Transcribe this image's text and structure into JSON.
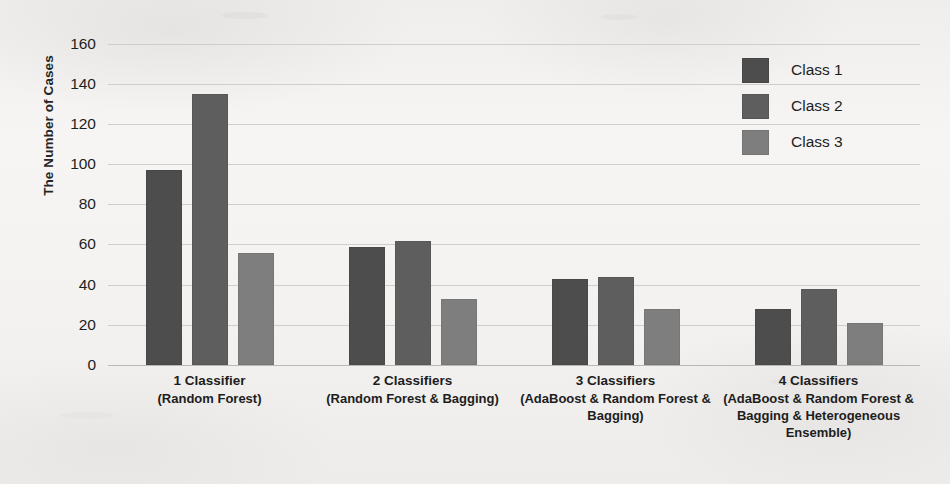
{
  "chart_data": {
    "type": "bar",
    "title": "",
    "xlabel": "",
    "ylabel": "The Number of Cases",
    "ylim": [
      0,
      160
    ],
    "ytick_step": 20,
    "yticks": [
      160,
      140,
      120,
      100,
      80,
      60,
      40,
      20,
      0
    ],
    "grid": true,
    "legend_position": "top-right",
    "categories": [
      "1 Classifier\n(Random Forest)",
      "2 Classifiers\n(Random Forest & Bagging)",
      "3 Classifiers\n(AdaBoost & Random Forest & Bagging)",
      "4 Classifiers\n(AdaBoost & Random Forest & Bagging & Heterogeneous Ensemble)"
    ],
    "series": [
      {
        "name": "Class 1",
        "color": "#4d4d4d",
        "values": [
          97,
          59,
          43,
          28
        ]
      },
      {
        "name": "Class 2",
        "color": "#5e5e5e",
        "values": [
          135,
          62,
          44,
          38
        ]
      },
      {
        "name": "Class 3",
        "color": "#7e7e7e",
        "values": [
          56,
          33,
          28,
          21
        ]
      }
    ]
  },
  "axis": {
    "y_title": "The Number of Cases",
    "y_ticks": [
      "160",
      "140",
      "120",
      "100",
      "80",
      "60",
      "40",
      "20",
      "0"
    ]
  },
  "x_categories": [
    {
      "line1": "1 Classifier",
      "line2": "(Random Forest)"
    },
    {
      "line1": "2 Classifiers",
      "line2": "(Random Forest & Bagging)"
    },
    {
      "line1": "3 Classifiers",
      "line2": "(AdaBoost & Random Forest & Bagging)"
    },
    {
      "line1": "4 Classifiers",
      "line2": "(AdaBoost & Random Forest & Bagging & Heterogeneous Ensemble)"
    }
  ],
  "legend": {
    "items": [
      {
        "label": "Class 1",
        "color": "#4d4d4d"
      },
      {
        "label": "Class 2",
        "color": "#5e5e5e"
      },
      {
        "label": "Class 3",
        "color": "#7e7e7e"
      }
    ]
  }
}
